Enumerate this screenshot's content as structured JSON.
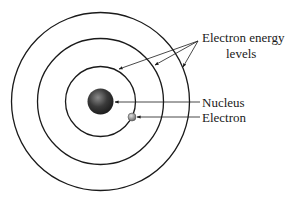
{
  "diagram": {
    "labels": {
      "energy_levels_line1": "Electron energy",
      "energy_levels_line2": "levels",
      "nucleus": "Nucleus",
      "electron": "Electron"
    },
    "center": {
      "x": 100.5,
      "y": 101.5
    },
    "orbit_radii": [
      35,
      63,
      89
    ],
    "nucleus_radius": 13,
    "electron_position": {
      "x": 132,
      "y": 117,
      "r": 4
    },
    "colors": {
      "line": "#1a1a1a",
      "nucleus_dark": "#2a2a2a",
      "nucleus_light": "#8a8a8a",
      "electron_dark": "#6a6a6a",
      "electron_light": "#d0d0d0",
      "background": "#ffffff"
    }
  }
}
